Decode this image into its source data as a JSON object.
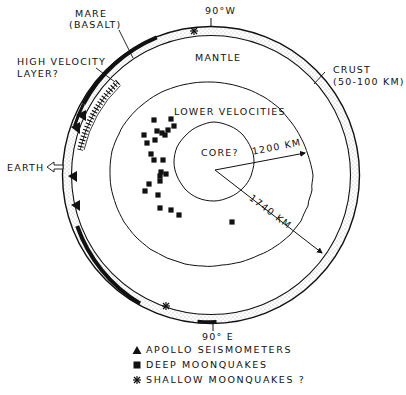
{
  "figure": {
    "type": "cross-section diagram of the Moon",
    "labels": {
      "mare": "MARE",
      "basalt": "(BASALT)",
      "high_velocity_1": "HIGH VELOCITY",
      "high_velocity_2": "LAYER?",
      "west": "90°W",
      "east": "90° E",
      "mantle": "MANTLE",
      "crust_1": "CRUST",
      "crust_2": "(50-100 KM)",
      "lower_velocities": "LOWER VELOCITIES",
      "core": "CORE?",
      "r_inner": "1200 KM",
      "r_outer": "1740 KM",
      "earth": "EARTH"
    },
    "geometry": {
      "center": [
        211,
        175
      ],
      "outer_radius_px": 148,
      "crust_thickness_px": 9,
      "lower_velocity_radius_px": 102,
      "core_center": [
        214,
        162
      ],
      "core_radius_px": 40,
      "outer_radius_km": 1740,
      "lower_velocity_radius_km": 1200
    },
    "deep_moonquakes": [
      [
        154,
        120
      ],
      [
        171,
        119
      ],
      [
        174,
        126
      ],
      [
        144,
        135
      ],
      [
        157,
        131
      ],
      [
        162,
        133
      ],
      [
        168,
        130
      ],
      [
        165,
        135
      ],
      [
        155,
        140
      ],
      [
        147,
        143
      ],
      [
        151,
        154
      ],
      [
        154,
        160
      ],
      [
        163,
        160
      ],
      [
        161,
        172
      ],
      [
        166,
        174
      ],
      [
        160,
        176
      ],
      [
        149,
        184
      ],
      [
        145,
        191
      ],
      [
        160,
        181
      ],
      [
        158,
        195
      ],
      [
        160,
        208
      ],
      [
        171,
        210
      ],
      [
        179,
        215
      ],
      [
        232,
        222
      ]
    ],
    "apollo_seismometers_deg": [
      146,
      155,
      172,
      185
    ],
    "shallow_moonquakes_deg": [
      83,
      237
    ],
    "colors": {
      "ink": "#111111",
      "paper": "#ffffff",
      "stipple": "#9a9a9a"
    }
  },
  "legend": {
    "items": [
      {
        "symbol": "triangle",
        "label": "APOLLO SEISMOMETERS"
      },
      {
        "symbol": "square",
        "label": "DEEP MOONQUAKES"
      },
      {
        "symbol": "asterisk",
        "label": "SHALLOW MOONQUAKES ?"
      }
    ]
  }
}
